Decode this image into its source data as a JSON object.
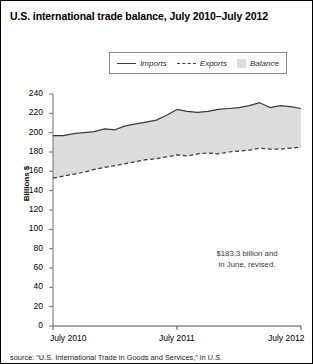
{
  "figure": {
    "title": "U.S. international trade balance, July 2010–July 2012",
    "annotation_line1": "$183.3 billion and",
    "annotation_line2": "in June, revised.",
    "source_prefix": "source: “U.S. International Trade in Goods and Services,” in ",
    "source_italic": "U.S."
  },
  "legend": {
    "imports_label": "Imports",
    "exports_label": "Exports",
    "balance_label": "Balance",
    "imports_swatch": "solid-line-swatch",
    "exports_swatch": "dashed-line-swatch",
    "balance_swatch": "gray-fill-swatch"
  },
  "colors": {
    "line": "#3a3a3a",
    "balance_fill": "#dcdcdc",
    "axis": "#6e6e6e",
    "text": "#000000",
    "frame": "#000000"
  },
  "chart_data": {
    "type": "area",
    "title": "U.S. international trade balance, July 2010–July 2012",
    "xlabel": "",
    "ylabel": "Billions $",
    "ylim": [
      0,
      240
    ],
    "ytick_step": 20,
    "yticks": [
      0,
      20,
      40,
      60,
      80,
      100,
      120,
      140,
      160,
      180,
      200,
      220,
      240
    ],
    "xticks": [
      0,
      12,
      24
    ],
    "xtick_labels": [
      "July 2010",
      "July 2011",
      "July 2012"
    ],
    "grid": false,
    "legend_position": "top-center",
    "annotations": [
      {
        "text": "$183.3 billion and in June, revised.",
        "x": 18.5,
        "y": 62
      }
    ],
    "x": [
      0,
      1,
      2,
      3,
      4,
      5,
      6,
      7,
      8,
      9,
      10,
      11,
      12,
      13,
      14,
      15,
      16,
      17,
      18,
      19,
      20,
      21,
      22,
      23,
      24
    ],
    "x_month_labels": [
      "Jul 2010",
      "Aug 2010",
      "Sep 2010",
      "Oct 2010",
      "Nov 2010",
      "Dec 2010",
      "Jan 2011",
      "Feb 2011",
      "Mar 2011",
      "Apr 2011",
      "May 2011",
      "Jun 2011",
      "Jul 2011",
      "Aug 2011",
      "Sep 2011",
      "Oct 2011",
      "Nov 2011",
      "Dec 2011",
      "Jan 2012",
      "Feb 2012",
      "Mar 2012",
      "Apr 2012",
      "May 2012",
      "Jun 2012",
      "Jul 2012"
    ],
    "series": [
      {
        "name": "Imports",
        "style": "solid",
        "values": [
          197,
          197,
          199,
          200,
          201,
          204,
          203,
          207,
          209,
          211,
          213,
          218,
          224,
          222,
          221,
          222,
          224,
          225,
          226,
          228,
          231,
          226,
          228,
          227,
          225
        ]
      },
      {
        "name": "Exports",
        "style": "dashed",
        "values": [
          153,
          155,
          157,
          159,
          162,
          164,
          166,
          168,
          170,
          172,
          173,
          175,
          177,
          176,
          178,
          179,
          178,
          180,
          181,
          182,
          184,
          183,
          183,
          184,
          185
        ]
      },
      {
        "name": "Balance",
        "style": "fill",
        "values": [
          -44,
          -42,
          -42,
          -41,
          -39,
          -40,
          -37,
          -39,
          -39,
          -39,
          -40,
          -43,
          -47,
          -46,
          -43,
          -43,
          -46,
          -45,
          -45,
          -46,
          -47,
          -43,
          -45,
          -43,
          -40
        ]
      }
    ]
  }
}
